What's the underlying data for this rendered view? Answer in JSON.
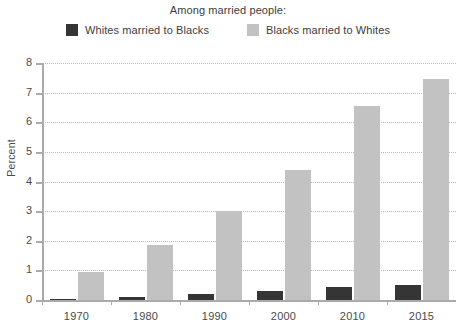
{
  "chart_data": {
    "type": "bar",
    "title": "",
    "subtitle": "Among married people:",
    "xlabel": "",
    "ylabel": "Percent",
    "categories": [
      "1970",
      "1980",
      "1990",
      "2000",
      "2010",
      "2015"
    ],
    "series": [
      {
        "name": "Whites married to Blacks",
        "color": "#353535",
        "values": [
          0.05,
          0.1,
          0.2,
          0.3,
          0.45,
          0.5
        ]
      },
      {
        "name": "Blacks married to Whites",
        "color": "#c2c2c2",
        "values": [
          0.95,
          1.85,
          3.0,
          4.4,
          6.55,
          7.45
        ]
      }
    ],
    "ylim": [
      0,
      8
    ],
    "ytick_labels": [
      "0",
      "1",
      "2",
      "3",
      "4",
      "5",
      "6",
      "7",
      "8"
    ],
    "ytick_values": [
      0,
      1,
      2,
      3,
      4,
      5,
      6,
      7,
      8
    ],
    "grid": true,
    "grid_style": "dotted-horizontal",
    "legend_position": "top-center",
    "background_color": "#ffffff",
    "axis_color": "#aaaaaa"
  }
}
